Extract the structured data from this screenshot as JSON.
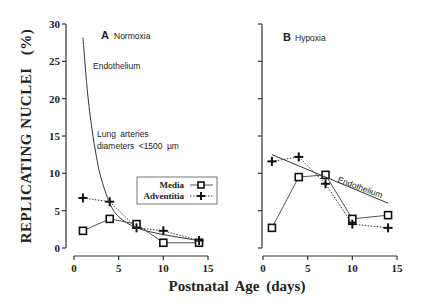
{
  "chart_data": {
    "type": "line",
    "ylabel": "REPLICATING NUCLEI",
    "ylabel_unit": "(%)",
    "xlabel": "Postnatal  Age  (days)",
    "ylim": [
      0,
      30
    ],
    "xlim": [
      0,
      15
    ],
    "yticks": [
      "0",
      "5",
      "10",
      "15",
      "20",
      "25",
      "30"
    ],
    "xticks": [
      "0",
      "5",
      "10",
      "15"
    ],
    "legend": {
      "position": "center-right of panel A",
      "entries": [
        {
          "name": "Media",
          "marker": "square",
          "style": "solid"
        },
        {
          "name": "Adventitia",
          "marker": "plus",
          "style": "dotted"
        }
      ]
    },
    "panels": [
      {
        "label": "A",
        "title": "Normoxia",
        "annotations": [
          "Endothelium",
          "Lung  arteries",
          "diameters  <1500  µm"
        ],
        "series": [
          {
            "name": "Media",
            "x": [
              1,
              4,
              7,
              10,
              14
            ],
            "values": [
              2.3,
              3.9,
              3.2,
              0.7,
              0.7
            ]
          },
          {
            "name": "Adventitia",
            "x": [
              1,
              4,
              7,
              10,
              14
            ],
            "values": [
              6.7,
              6.2,
              2.7,
              2.3,
              1.0
            ]
          },
          {
            "name": "Endothelium",
            "x": [
              1,
              1.5,
              2,
              2.5,
              3,
              4,
              5,
              7,
              10,
              14
            ],
            "values": [
              28.2,
              21,
              16,
              12.3,
              9.5,
              6.0,
              4.2,
              2.7,
              1.8,
              1.0
            ]
          }
        ]
      },
      {
        "label": "B",
        "title": "Hypoxia",
        "annotations": [
          "Endothelium"
        ],
        "series": [
          {
            "name": "Media",
            "x": [
              1,
              4,
              7,
              10,
              14
            ],
            "values": [
              2.7,
              9.5,
              9.8,
              3.9,
              4.4
            ]
          },
          {
            "name": "Adventitia",
            "x": [
              1,
              4,
              7,
              10,
              14
            ],
            "values": [
              11.6,
              12.2,
              8.6,
              3.2,
              2.7
            ]
          },
          {
            "name": "Endothelium",
            "x": [
              1,
              14
            ],
            "values": [
              12.5,
              6.0
            ]
          }
        ]
      }
    ]
  }
}
